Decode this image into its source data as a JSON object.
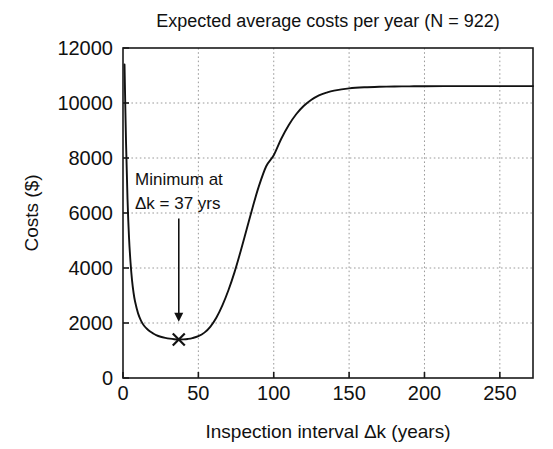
{
  "chart_data": {
    "type": "line",
    "title": "Expected average costs per year (N = 922)",
    "xlabel": "Inspection interval Δk (years)",
    "ylabel": "Costs ($)",
    "xlim": [
      0,
      272
    ],
    "ylim": [
      0,
      12000
    ],
    "grid": true,
    "legend": "none",
    "xticks": [
      0,
      50,
      100,
      150,
      200,
      250
    ],
    "xtick_labels": [
      "0",
      "50",
      "100",
      "150",
      "200",
      "250"
    ],
    "yticks": [
      0,
      2000,
      4000,
      6000,
      8000,
      10000,
      12000
    ],
    "ytick_labels": [
      "0",
      "2000",
      "4000",
      "6000",
      "8000",
      "10000",
      "12000"
    ],
    "series": [
      {
        "name": "Expected average costs per year",
        "x": [
          1,
          2,
          3,
          4,
          5,
          6,
          7,
          8,
          10,
          12,
          14,
          16,
          18,
          20,
          22,
          25,
          28,
          31,
          34,
          37,
          40,
          43,
          46,
          50,
          54,
          58,
          62,
          66,
          70,
          74,
          78,
          82,
          86,
          90,
          95,
          100,
          105,
          110,
          115,
          120,
          125,
          130,
          135,
          140,
          150,
          160,
          170,
          180,
          190,
          200,
          220,
          240,
          260,
          272
        ],
        "y": [
          11400,
          8600,
          6500,
          5100,
          4200,
          3550,
          3100,
          2780,
          2350,
          2080,
          1900,
          1780,
          1690,
          1620,
          1560,
          1500,
          1460,
          1430,
          1410,
          1400,
          1405,
          1420,
          1450,
          1520,
          1650,
          1870,
          2200,
          2650,
          3200,
          3850,
          4600,
          5400,
          6200,
          6950,
          7700,
          8100,
          8700,
          9200,
          9600,
          9900,
          10120,
          10280,
          10380,
          10450,
          10530,
          10570,
          10590,
          10600,
          10605,
          10610,
          10615,
          10615,
          10615,
          10615
        ]
      }
    ],
    "annotations": [
      {
        "name": "minimum-annotation",
        "line1": "Minimum at",
        "line2": "Δk = 37 yrs",
        "arrow_from_x": 37,
        "arrow_from_y": 5800,
        "arrow_to_x": 37,
        "arrow_to_y": 2050
      }
    ],
    "markers": [
      {
        "name": "minimum-marker",
        "symbol": "x",
        "x": 37,
        "y": 1400
      }
    ],
    "colors": {
      "curve": "#111111",
      "grid": "#9a9a9a",
      "axis": "#1a1a1a",
      "background": "#ffffff"
    }
  }
}
